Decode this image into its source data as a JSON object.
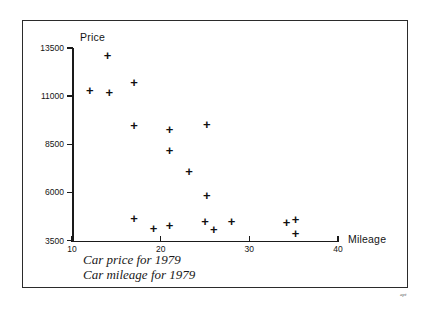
{
  "figure": {
    "caption_line1": "Car price for 1979",
    "caption_line2": "Car mileage for 1979",
    "corner_mark": "apt"
  },
  "chart_data": {
    "type": "scatter",
    "title": "",
    "xlabel": "Mileage",
    "ylabel": "Price",
    "xlim": [
      10,
      40
    ],
    "ylim": [
      3500,
      13500
    ],
    "xticks": [
      10,
      20,
      30,
      40
    ],
    "yticks": [
      3500,
      6000,
      8500,
      11000,
      13500
    ],
    "xtick_labels": [
      "10",
      "20",
      "30",
      "40"
    ],
    "ytick_labels": [
      "3500",
      "6000",
      "8500",
      "11000",
      "13500"
    ],
    "grid": false,
    "legend": false,
    "marker": "+",
    "marker_color": "#111111",
    "points": [
      {
        "x": 12.0,
        "y": 11300
      },
      {
        "x": 14.0,
        "y": 13100
      },
      {
        "x": 14.2,
        "y": 11200
      },
      {
        "x": 17.0,
        "y": 11700
      },
      {
        "x": 17.0,
        "y": 9450
      },
      {
        "x": 21.0,
        "y": 9250
      },
      {
        "x": 21.0,
        "y": 8200
      },
      {
        "x": 23.2,
        "y": 7100
      },
      {
        "x": 25.2,
        "y": 9550
      },
      {
        "x": 25.2,
        "y": 5850
      },
      {
        "x": 17.0,
        "y": 4650
      },
      {
        "x": 19.2,
        "y": 4100
      },
      {
        "x": 21.0,
        "y": 4300
      },
      {
        "x": 25.0,
        "y": 4500
      },
      {
        "x": 26.0,
        "y": 4050
      },
      {
        "x": 28.0,
        "y": 4500
      },
      {
        "x": 34.2,
        "y": 4450
      },
      {
        "x": 35.2,
        "y": 4600
      },
      {
        "x": 35.2,
        "y": 3850
      }
    ]
  }
}
